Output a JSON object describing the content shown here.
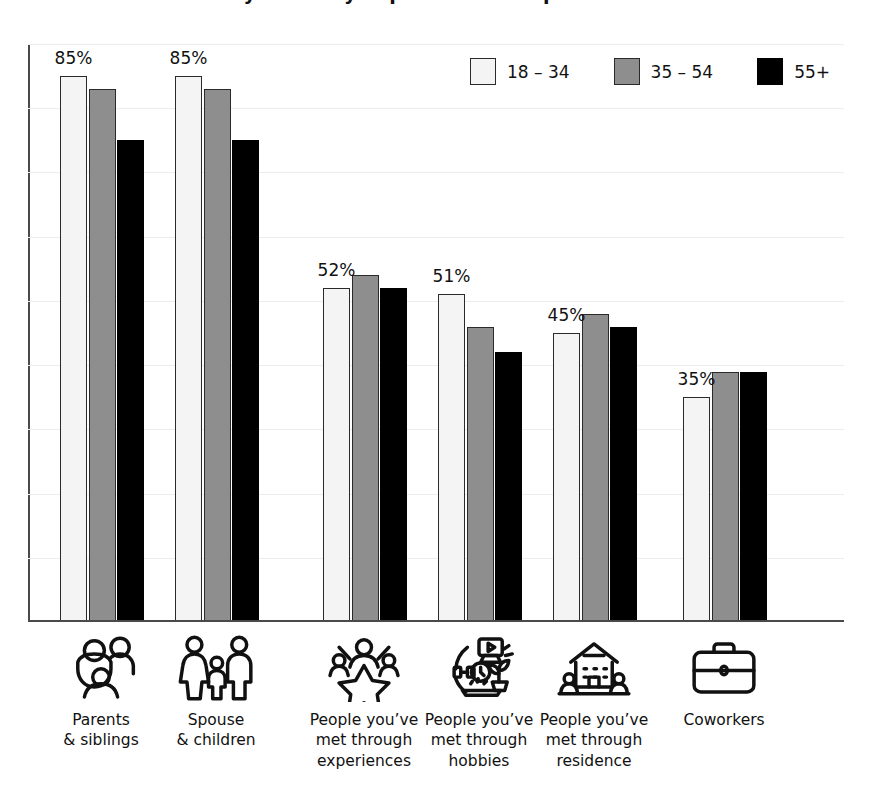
{
  "title": "Adults say it is very important to keep in touch with...",
  "legend": {
    "position": "top-right",
    "items": [
      {
        "label": "18 – 34",
        "key": "18-34",
        "color": "#f4f4f4",
        "swatch_name": "legend-swatch-18-34"
      },
      {
        "label": "35 – 54",
        "key": "35-54",
        "color": "#8e8e8e",
        "swatch_name": "legend-swatch-35-54"
      },
      {
        "label": "55+",
        "key": "55+",
        "color": "#000000",
        "swatch_name": "legend-swatch-55-plus"
      }
    ]
  },
  "axis": {
    "y_min": 0,
    "y_max": 90,
    "gridline_step": 10,
    "gridlines_visible": true,
    "tick_labels_visible": false
  },
  "categories": [
    {
      "id": "parents-siblings",
      "label": "Parents\n& siblings",
      "icon": "family-parents-siblings-icon"
    },
    {
      "id": "spouse-children",
      "label": "Spouse\n& children",
      "icon": "family-spouse-children-icon"
    },
    {
      "id": "met-experiences",
      "label": "People you’ve\nmet through\nexperiences",
      "icon": "people-star-experiences-icon"
    },
    {
      "id": "met-hobbies",
      "label": "People you’ve\nmet through\nhobbies",
      "icon": "hobbies-collage-icon"
    },
    {
      "id": "met-residence",
      "label": "People you’ve\nmet through\nresidence",
      "icon": "house-neighbors-icon"
    },
    {
      "id": "coworkers",
      "label": "Coworkers",
      "icon": "briefcase-icon"
    }
  ],
  "data_labels": [
    "85%",
    "85%",
    "52%",
    "51%",
    "45%",
    "35%"
  ],
  "chart_data": {
    "type": "bar",
    "title": "Adults say it is very important to keep in touch with...",
    "xlabel": "",
    "ylabel": "",
    "ylim": [
      0,
      90
    ],
    "grid": true,
    "legend_position": "top-right",
    "value_suffix": "%",
    "categories": [
      "Parents & siblings",
      "Spouse & children",
      "People you’ve met through experiences",
      "People you’ve met through hobbies",
      "People you’ve met through residence",
      "Coworkers"
    ],
    "series": [
      {
        "name": "18 – 34",
        "color": "#f4f4f4",
        "values": [
          85,
          85,
          52,
          51,
          45,
          35
        ]
      },
      {
        "name": "35 – 54",
        "color": "#8e8e8e",
        "values": [
          83,
          83,
          54,
          46,
          48,
          39
        ]
      },
      {
        "name": "55+",
        "color": "#000000",
        "values": [
          75,
          75,
          52,
          42,
          46,
          39
        ]
      }
    ],
    "annotations": [
      {
        "category": "Parents & siblings",
        "text": "85%"
      },
      {
        "category": "Spouse & children",
        "text": "85%"
      },
      {
        "category": "People you’ve met through experiences",
        "text": "52%"
      },
      {
        "category": "People you’ve met through hobbies",
        "text": "51%"
      },
      {
        "category": "People you’ve met through residence",
        "text": "45%"
      },
      {
        "category": "Coworkers",
        "text": "35%"
      }
    ]
  }
}
